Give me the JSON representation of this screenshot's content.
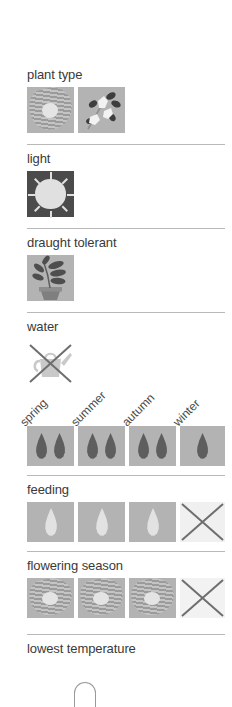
{
  "panel": {
    "title": "plant care attributes panel",
    "background": "#ffffff",
    "text_color": "#3a3a3a",
    "divider_color": "#b9b9b9"
  },
  "sections": [
    {
      "key": "plant_type",
      "label": "plant type",
      "icons": [
        "striped-flower-icon",
        "flowering-sprig-icon"
      ],
      "tile_color": "#b3b3b3"
    },
    {
      "key": "light",
      "label": "light",
      "icons": [
        "sun-icon"
      ],
      "tile_color": "#4b4b4b"
    },
    {
      "key": "draught_tolerant",
      "label": "draught tolerant",
      "icons": [
        "potted-plant-icon"
      ],
      "tile_color": "#b3b3b3"
    },
    {
      "key": "water",
      "label": "water",
      "icons": [
        "watering-can-crossed-out-icon"
      ],
      "tile_color": "#ffffff"
    },
    {
      "key": "seasons",
      "label": "",
      "columns": [
        "spring",
        "summer",
        "autumn",
        "winter"
      ]
    },
    {
      "key": "water_amount",
      "label": "",
      "values": [
        2,
        2,
        2,
        1
      ],
      "icon": "water-droplet-icon",
      "droplet_color": "#5e5e5e",
      "tile_color": "#b3b3b3"
    },
    {
      "key": "feeding",
      "label": "feeding",
      "values": [
        1,
        1,
        1,
        0
      ],
      "icon": "feeding-droplet-icon",
      "droplet_color": "#e2e2e2",
      "tile_color": "#b3b3b3",
      "crossed_out_last": true
    },
    {
      "key": "flowering_season",
      "label": "flowering season",
      "values": [
        1,
        1,
        1,
        0
      ],
      "icon": "flower-icon",
      "tile_color": "#b3b3b3",
      "crossed_out_last": true
    },
    {
      "key": "lowest_temperature",
      "label": "lowest temperature",
      "icons": [
        "thermometer-icon"
      ]
    }
  ],
  "labels": {
    "plant_type": "plant type",
    "light": "light",
    "draught_tolerant": "draught tolerant",
    "water": "water",
    "feeding": "feeding",
    "flowering_season": "flowering season",
    "lowest_temperature": "lowest temperature",
    "spring": "spring",
    "summer": "summer",
    "autumn": "autumn",
    "winter": "winter"
  }
}
